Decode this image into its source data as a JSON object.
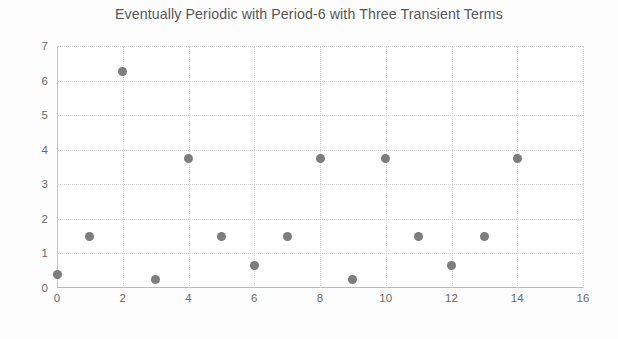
{
  "chart_data": {
    "type": "scatter",
    "title": "Eventually Periodic with Period-6 with Three Transient Terms",
    "xlabel": "",
    "ylabel": "",
    "xlim": [
      0,
      16
    ],
    "ylim": [
      0,
      7
    ],
    "xticks": [
      0,
      2,
      4,
      6,
      8,
      10,
      12,
      14,
      16
    ],
    "yticks": [
      0,
      1,
      2,
      3,
      4,
      5,
      6,
      7
    ],
    "grid": true,
    "grid_style": "dotted",
    "legend": null,
    "marker": {
      "shape": "circle",
      "color": "#7d7d7d",
      "size_px": 9
    },
    "series": [
      {
        "name": "sequence",
        "x": [
          0,
          1,
          2,
          3,
          4,
          5,
          6,
          7,
          8,
          9,
          10,
          11,
          12,
          13,
          14
        ],
        "y": [
          0.4,
          1.5,
          6.25,
          0.25,
          3.75,
          1.5,
          0.65,
          1.5,
          3.75,
          0.25,
          3.75,
          1.5,
          0.65,
          1.5,
          3.75
        ]
      }
    ],
    "points": [
      {
        "x": 0,
        "y": 0.4
      },
      {
        "x": 1,
        "y": 1.5
      },
      {
        "x": 2,
        "y": 6.25
      },
      {
        "x": 3,
        "y": 0.25
      },
      {
        "x": 4,
        "y": 3.75
      },
      {
        "x": 5,
        "y": 1.5
      },
      {
        "x": 6,
        "y": 0.65
      },
      {
        "x": 7,
        "y": 1.5
      },
      {
        "x": 8,
        "y": 3.75
      },
      {
        "x": 9,
        "y": 0.25
      },
      {
        "x": 10,
        "y": 3.75
      },
      {
        "x": 11,
        "y": 1.5
      },
      {
        "x": 12,
        "y": 0.65
      },
      {
        "x": 13,
        "y": 1.5
      },
      {
        "x": 14,
        "y": 3.75
      }
    ]
  },
  "colors": {
    "marker": "#7d7d7d",
    "grid": "#d2d2d2",
    "axis": "#bdbdbd",
    "text": "#5c5c5c",
    "background": "#ffffff"
  }
}
